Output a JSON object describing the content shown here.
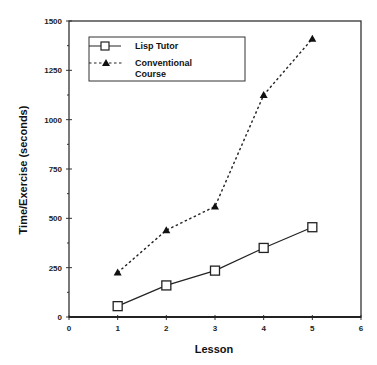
{
  "chart_data": {
    "type": "line",
    "title": "",
    "xlabel": "Lesson",
    "ylabel": "Time/Exercise (seconds)",
    "xlim": [
      0,
      6
    ],
    "ylim": [
      0,
      1500
    ],
    "x_ticks": [
      "0",
      "1",
      "2",
      "3",
      "4",
      "5",
      "6"
    ],
    "y_ticks": [
      "0",
      "250",
      "500",
      "750",
      "1000",
      "1250",
      "1500"
    ],
    "grid": false,
    "legend_position": "upper left",
    "x": [
      1,
      2,
      3,
      4,
      5
    ],
    "series": [
      {
        "name": "Lisp Tutor",
        "marker": "open-square",
        "line": "solid",
        "values": [
          55,
          160,
          235,
          350,
          455
        ]
      },
      {
        "name": "Conventional Course",
        "marker": "filled-triangle",
        "line": "dashed",
        "values": [
          225,
          440,
          560,
          1125,
          1410
        ]
      }
    ]
  },
  "legend": {
    "items": [
      {
        "label_lines": [
          "Lisp Tutor"
        ]
      },
      {
        "label_lines": [
          "Conventional",
          "Course"
        ]
      }
    ]
  }
}
